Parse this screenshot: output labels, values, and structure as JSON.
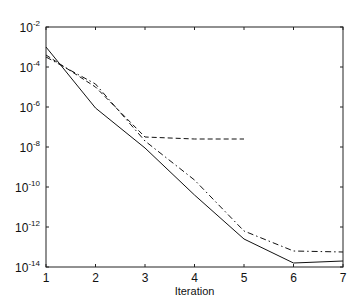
{
  "chart_data": {
    "type": "line",
    "title": "",
    "xlabel": "Iteration",
    "ylabel": "",
    "yscale": "log",
    "xlim": [
      1,
      7
    ],
    "ylim": [
      1e-14,
      0.01
    ],
    "grid": false,
    "legend": null,
    "x_ticks": [
      "1",
      "2",
      "3",
      "4",
      "5",
      "6",
      "7"
    ],
    "y_ticks": [
      {
        "base": "10",
        "exp": "-2"
      },
      {
        "base": "10",
        "exp": "-4"
      },
      {
        "base": "10",
        "exp": "-6"
      },
      {
        "base": "10",
        "exp": "-8"
      },
      {
        "base": "10",
        "exp": "-10"
      },
      {
        "base": "10",
        "exp": "-12"
      },
      {
        "base": "10",
        "exp": "-14"
      }
    ],
    "series": [
      {
        "name": "solid",
        "style": "solid",
        "x": [
          1,
          2,
          3,
          4,
          5,
          6,
          7
        ],
        "log10_y": [
          -3.0,
          -6.05,
          -8.05,
          -10.4,
          -12.6,
          -13.8,
          -13.7
        ]
      },
      {
        "name": "dashed",
        "style": "dashed",
        "x": [
          1,
          2,
          3,
          4,
          5
        ],
        "log10_y": [
          -3.4,
          -5.0,
          -7.5,
          -7.6,
          -7.6
        ]
      },
      {
        "name": "dash-dot",
        "style": "dashdot",
        "x": [
          1,
          2,
          3,
          4,
          5,
          6,
          7
        ],
        "log10_y": [
          -3.5,
          -4.85,
          -7.7,
          -9.65,
          -12.2,
          -13.2,
          -13.25
        ]
      }
    ]
  }
}
